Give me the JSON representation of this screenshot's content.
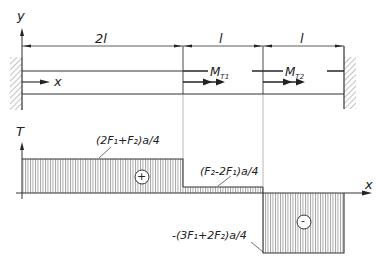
{
  "axes": {
    "beam_y_label": "y",
    "beam_x_label": "x",
    "torque_label": "T",
    "torque_x_label": "x"
  },
  "dimensions": [
    {
      "label": "2l"
    },
    {
      "label": "l"
    },
    {
      "label": "l"
    }
  ],
  "moments": [
    {
      "label": "M",
      "sub": "T1"
    },
    {
      "label": "M",
      "sub": "T2"
    }
  ],
  "torque_values": {
    "segment1": "(2F₁+F₂)a/4",
    "segment2": "(F₂-2F₁)a/4",
    "segment3": "-(3F₁+2F₂)a/4"
  },
  "signs": {
    "positive": "+",
    "negative": "-"
  },
  "colors": {
    "line": "#333333",
    "hatch": "#555555"
  }
}
